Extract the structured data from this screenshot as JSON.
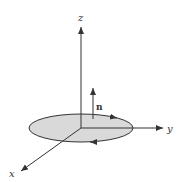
{
  "diagram": {
    "axes": {
      "z": {
        "label": "z"
      },
      "y": {
        "label": "y"
      },
      "x": {
        "label": "x"
      }
    },
    "normal_vector": {
      "label": "n"
    },
    "disk": {
      "fill": "#d9d9d9",
      "stroke": "#333333"
    },
    "colors": {
      "line": "#333333",
      "background": "#ffffff"
    }
  }
}
